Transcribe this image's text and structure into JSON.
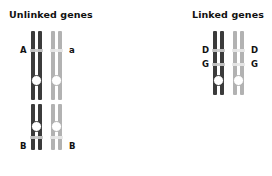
{
  "figure": {
    "panels": [
      {
        "id": "unlinked",
        "title": "Unlinked genes",
        "pairs": [
          {
            "id": "pair-a",
            "labels": {
              "left": "A",
              "right": "a"
            }
          },
          {
            "id": "pair-b",
            "labels": {
              "left": "B",
              "right": "B"
            }
          }
        ]
      },
      {
        "id": "linked",
        "title": "Linked genes",
        "pairs": [
          {
            "id": "pair-dg",
            "labels": {
              "left_top": "D",
              "right_top": "D",
              "left_bottom": "G",
              "right_bottom": "G"
            }
          }
        ]
      }
    ]
  },
  "colors": {
    "background": "#ffffff",
    "chromosome_dark": "#3b3b3b",
    "chromosome_light": "#b2b2b2",
    "band": "#c9c9c9",
    "centromere_fill": "#ffffff",
    "text": "#111111"
  }
}
